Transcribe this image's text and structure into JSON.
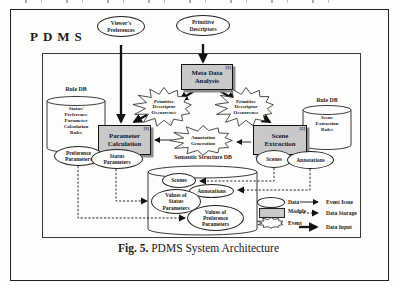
{
  "system_label": "PDMS",
  "caption": {
    "fig_label": "Fig. 5.",
    "title_text": " PDMS System Architecture"
  },
  "nodes": {
    "viewers_preferences": {
      "label": "Viewer's\nPreferences"
    },
    "primitive_descriptors": {
      "label": "Primitive\nDescriptors"
    },
    "meta_data_analysis": {
      "label": "Meta Data\nAnalysis",
      "ref": "[1]"
    },
    "pdo_left": {
      "label": "Primitive\nDescriptor\nOccurrence"
    },
    "pdo_right": {
      "label": "Primitive\nDescriptor\nOccurrence"
    },
    "parameter_calculation": {
      "label": "Parameter\nCalculation",
      "ref": "[3]"
    },
    "annotation_generation": {
      "label": "Annotation\nGeneration"
    },
    "scene_extraction": {
      "label": "Scene\nExtraction",
      "ref": "[2]"
    },
    "rule_db_left": {
      "title": "Rule DB",
      "content": "Status/\nPreference\nParameter\nCalculation\nRules"
    },
    "rule_db_right": {
      "title": "Rule DB",
      "content": "Scene\nExtraction\nRules"
    },
    "preference_parameters": {
      "label": "Preference\nParameters"
    },
    "status_parameters": {
      "label": "Status\nParameters"
    },
    "scenes_output": {
      "label": "Scenes"
    },
    "annotations_output": {
      "label": "Annotations"
    },
    "semantic_db": {
      "title": "Semantic Structure DB"
    },
    "db_scenes": {
      "label": "Scenes"
    },
    "db_annotations": {
      "label": "Annotations"
    },
    "db_values_status": {
      "label": "Values of\nStatus\nParameters"
    },
    "db_values_preference": {
      "label": "Values of\nPreference\nParameters"
    }
  },
  "legend": {
    "data_label": "Data",
    "module_label": "Module",
    "event_label": "Event",
    "event_issue_label": "Event Issue",
    "data_storage_label": "Data Storage",
    "data_input_label": "Data Input"
  },
  "colors": {
    "module_fill": "#c9c9c9",
    "module_shadow": "#8f8f8f",
    "ink": "#1b1b1b"
  }
}
